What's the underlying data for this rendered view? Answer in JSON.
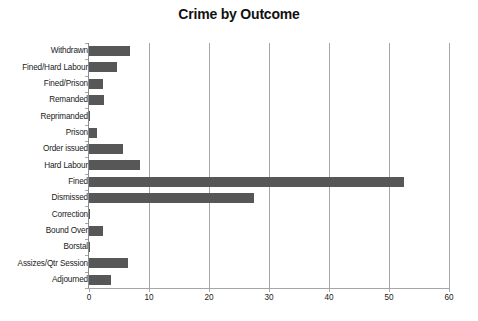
{
  "chart_data": {
    "type": "bar",
    "orientation": "horizontal",
    "title": "Crime by Outcome",
    "xlabel": "",
    "ylabel": "",
    "xlim": [
      0,
      60
    ],
    "ylim": null,
    "grid": "vertical",
    "legend": "none",
    "bar_color": "#575757",
    "gridline_color": "#A6A6A6",
    "axis_color": "#8C8C8C",
    "xticks": [
      0,
      10,
      20,
      30,
      40,
      50,
      60
    ],
    "xtick_labels": [
      "0",
      "10",
      "20",
      "30",
      "40",
      "50",
      "60"
    ],
    "categories": [
      "Withdrawn",
      "Fined/Hard Labour",
      "Fined/Prison",
      "Remanded",
      "Reprimanded",
      "Prison",
      "Order issued",
      "Hard Labour",
      "Fined",
      "Dismissed",
      "Correction",
      "Bound Over",
      "Borstal",
      "Assizes/Qtr Session",
      "Adjourned"
    ],
    "values": [
      6.8,
      4.7,
      2.4,
      2.5,
      0.1,
      1.4,
      5.6,
      8.5,
      52.5,
      27.5,
      0.1,
      2.4,
      0.1,
      6.5,
      3.6
    ]
  }
}
